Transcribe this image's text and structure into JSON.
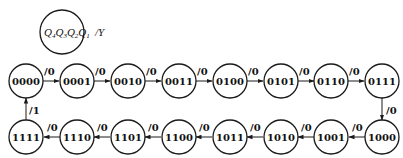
{
  "legend": {
    "state_format": [
      "Q",
      "4",
      "Q",
      "3",
      "Q",
      "2",
      "Q",
      "1"
    ],
    "output_label": "/Y"
  },
  "states": [
    {
      "id": "0000",
      "label": "0000"
    },
    {
      "id": "0001",
      "label": "0001"
    },
    {
      "id": "0010",
      "label": "0010"
    },
    {
      "id": "0011",
      "label": "0011"
    },
    {
      "id": "0100",
      "label": "0100"
    },
    {
      "id": "0101",
      "label": "0101"
    },
    {
      "id": "0110",
      "label": "0110"
    },
    {
      "id": "0111",
      "label": "0111"
    },
    {
      "id": "1000",
      "label": "1000"
    },
    {
      "id": "1001",
      "label": "1001"
    },
    {
      "id": "1010",
      "label": "1010"
    },
    {
      "id": "1011",
      "label": "1011"
    },
    {
      "id": "1100",
      "label": "1100"
    },
    {
      "id": "1101",
      "label": "1101"
    },
    {
      "id": "1110",
      "label": "1110"
    },
    {
      "id": "1111",
      "label": "1111"
    }
  ],
  "transitions": [
    {
      "from": "0000",
      "to": "0001",
      "label": "/0"
    },
    {
      "from": "0001",
      "to": "0010",
      "label": "/0"
    },
    {
      "from": "0010",
      "to": "0011",
      "label": "/0"
    },
    {
      "from": "0011",
      "to": "0100",
      "label": "/0"
    },
    {
      "from": "0100",
      "to": "0101",
      "label": "/0"
    },
    {
      "from": "0101",
      "to": "0110",
      "label": "/0"
    },
    {
      "from": "0110",
      "to": "0111",
      "label": "/0"
    },
    {
      "from": "0111",
      "to": "1000",
      "label": "/0"
    },
    {
      "from": "1000",
      "to": "1001",
      "label": "/0"
    },
    {
      "from": "1001",
      "to": "1010",
      "label": "/0"
    },
    {
      "from": "1010",
      "to": "1011",
      "label": "/0"
    },
    {
      "from": "1011",
      "to": "1100",
      "label": "/0"
    },
    {
      "from": "1100",
      "to": "1101",
      "label": "/0"
    },
    {
      "from": "1101",
      "to": "1110",
      "label": "/0"
    },
    {
      "from": "1110",
      "to": "1111",
      "label": "/0"
    },
    {
      "from": "1111",
      "to": "0000",
      "label": "/1"
    }
  ]
}
